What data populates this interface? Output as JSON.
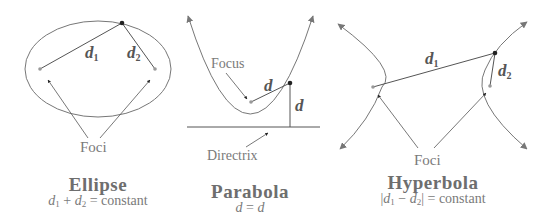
{
  "colors": {
    "stroke": "#777777",
    "point": "#222222",
    "focus_point": "#999999",
    "text": "#7a7a7a",
    "title": "#6e6e6e"
  },
  "ellipse": {
    "title": "Ellipse",
    "formula": {
      "a": "d",
      "a_sub": "1",
      "op": "+",
      "b": "d",
      "b_sub": "2",
      "rhs": "= constant"
    },
    "d1_label": {
      "var": "d",
      "sub": "1"
    },
    "d2_label": {
      "var": "d",
      "sub": "2"
    },
    "foci_label": "Foci"
  },
  "parabola": {
    "title": "Parabola",
    "formula": {
      "lhs": "d",
      "eq": "=",
      "rhs": "d"
    },
    "focus_label": "Focus",
    "directrix_label": "Directrix",
    "d_label_1": "d",
    "d_label_2": "d"
  },
  "hyperbola": {
    "title": "Hyperbola",
    "formula": {
      "a": "d",
      "a_sub": "1",
      "op": "−",
      "b": "d",
      "b_sub": "2",
      "rhs": "= constant"
    },
    "d1_label": {
      "var": "d",
      "sub": "1"
    },
    "d2_label": {
      "var": "d",
      "sub": "2"
    },
    "foci_label": "Foci"
  }
}
